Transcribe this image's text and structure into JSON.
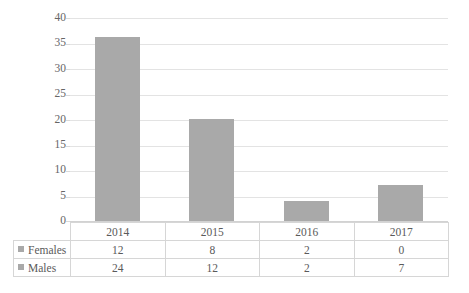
{
  "chart_data": {
    "type": "bar",
    "title": "",
    "subtitle": "",
    "xlabel": "",
    "ylabel": "",
    "categories": [
      "2014",
      "2015",
      "2016",
      "2017"
    ],
    "values": [
      36,
      20,
      4,
      7
    ],
    "series": [
      {
        "name": "Females",
        "values": [
          12,
          8,
          2,
          0
        ]
      },
      {
        "name": "Males",
        "values": [
          24,
          12,
          2,
          7
        ]
      }
    ],
    "ylim": [
      0,
      40
    ],
    "ytick_step": 5,
    "yticks": [
      "40",
      "35",
      "30",
      "25",
      "20",
      "15",
      "10",
      "5",
      "0"
    ],
    "grid": true,
    "legend_position": "table-row-labels",
    "bar_color": "#a9a9a9",
    "gridline_color": "#e3e3e3",
    "text_color": "#5f5f5f",
    "has_data_table": true
  },
  "table": {
    "header_row": [
      "",
      "2014",
      "2015",
      "2016",
      "2017"
    ],
    "rows": [
      {
        "label": "Females",
        "swatch": "legend-swatch-females",
        "cells": [
          "12",
          "8",
          "2",
          "0"
        ]
      },
      {
        "label": "Males",
        "swatch": "legend-swatch-males",
        "cells": [
          "24",
          "12",
          "2",
          "7"
        ]
      }
    ]
  }
}
